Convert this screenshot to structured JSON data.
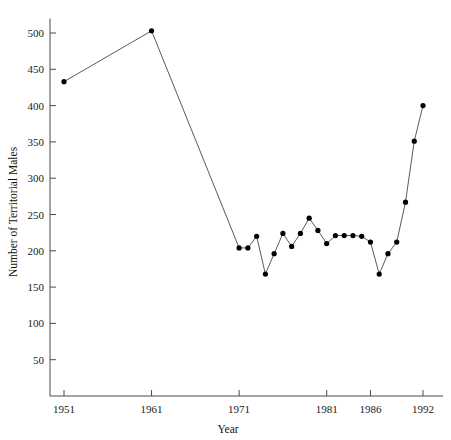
{
  "chart_data": {
    "type": "line",
    "title": "",
    "xlabel": "Year",
    "ylabel": "Number of Territorial Males",
    "xlim": [
      1950,
      1993
    ],
    "ylim": [
      0,
      520
    ],
    "grid": false,
    "legend": "none",
    "x_ticks": [
      1951,
      1961,
      1971,
      1981,
      1986,
      1992
    ],
    "x_tick_labels": [
      "1951",
      "1961",
      "1971",
      "1981",
      "1986",
      "1992"
    ],
    "y_ticks": [
      50,
      100,
      150,
      200,
      250,
      300,
      350,
      400,
      450,
      500
    ],
    "y_tick_labels": [
      "50",
      "100",
      "150",
      "200",
      "250",
      "300",
      "350",
      "400",
      "450",
      "500"
    ],
    "series": [
      {
        "name": "Territorial Males",
        "marker": "filled-circle",
        "marker_color": "#000000",
        "line_color": "#5a5a5a",
        "x": [
          1951,
          1961,
          1971,
          1972,
          1973,
          1974,
          1975,
          1976,
          1977,
          1978,
          1979,
          1980,
          1981,
          1982,
          1983,
          1984,
          1985,
          1986,
          1987,
          1988,
          1989,
          1990,
          1991,
          1992
        ],
        "values": [
          433,
          503,
          204,
          204,
          220,
          168,
          196,
          224,
          206,
          224,
          245,
          228,
          210,
          221,
          221,
          221,
          220,
          212,
          168,
          196,
          212,
          267,
          351,
          400
        ]
      }
    ]
  },
  "axis_label_color": "#111111",
  "background_color": "#ffffff"
}
